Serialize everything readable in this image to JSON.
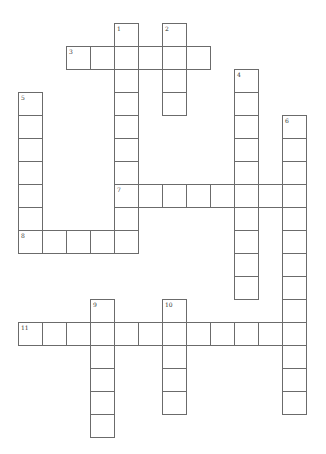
{
  "puzzle": {
    "grid": {
      "origin_x": 18,
      "origin_y": 23,
      "cell_w": 24,
      "cell_h": 23
    },
    "entries": [
      {
        "number": "1",
        "direction": "down",
        "row": 0,
        "col": 4,
        "length": 10
      },
      {
        "number": "2",
        "direction": "down",
        "row": 0,
        "col": 6,
        "length": 4
      },
      {
        "number": "3",
        "direction": "across",
        "row": 1,
        "col": 2,
        "length": 6
      },
      {
        "number": "4",
        "direction": "down",
        "row": 2,
        "col": 9,
        "length": 10
      },
      {
        "number": "5",
        "direction": "down",
        "row": 3,
        "col": 0,
        "length": 7
      },
      {
        "number": "6",
        "direction": "down",
        "row": 4,
        "col": 11,
        "length": 13
      },
      {
        "number": "7",
        "direction": "across",
        "row": 7,
        "col": 4,
        "length": 8
      },
      {
        "number": "8",
        "direction": "across",
        "row": 9,
        "col": 0,
        "length": 5
      },
      {
        "number": "9",
        "direction": "down",
        "row": 12,
        "col": 3,
        "length": 6
      },
      {
        "number": "10",
        "direction": "down",
        "row": 12,
        "col": 6,
        "length": 5
      },
      {
        "number": "11",
        "direction": "across",
        "row": 13,
        "col": 0,
        "length": 12
      }
    ]
  }
}
